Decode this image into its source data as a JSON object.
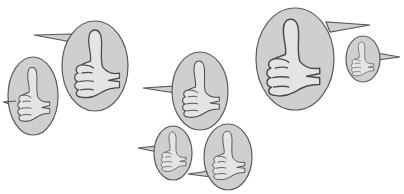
{
  "illustration": {
    "subject": "thumbs-up speech bubbles",
    "colors": {
      "background": "#ffffff",
      "bubble_fill": "#cfcfcf",
      "bubble_stroke": "#5a5a5a",
      "hand_fill": "#e4e4e4",
      "hand_stroke": "#4a4a4a"
    },
    "bubbles": [
      {
        "id": "a",
        "cx": 33,
        "cy": 96,
        "rx": 25,
        "ry": 39,
        "tail": "left",
        "tail_tip": [
          4,
          102
        ],
        "tail_base_y": [
          100,
          106
        ]
      },
      {
        "id": "b",
        "cx": 95,
        "cy": 66,
        "rx": 33,
        "ry": 45,
        "tail": "left",
        "tail_tip": [
          34,
          35
        ],
        "tail_base_y": [
          34,
          40
        ]
      },
      {
        "id": "c",
        "cx": 200,
        "cy": 91,
        "rx": 28,
        "ry": 39,
        "tail": "left",
        "tail_tip": [
          143,
          88
        ],
        "tail_base_y": [
          86,
          92
        ]
      },
      {
        "id": "d",
        "cx": 173,
        "cy": 153,
        "rx": 19,
        "ry": 27,
        "tail": "left",
        "tail_tip": [
          138,
          148
        ],
        "tail_base_y": [
          146,
          151
        ]
      },
      {
        "id": "e",
        "cx": 228,
        "cy": 157,
        "rx": 24,
        "ry": 33,
        "tail": "left",
        "tail_tip": [
          188,
          174
        ],
        "tail_base_y": [
          171,
          176
        ]
      },
      {
        "id": "f",
        "cx": 295,
        "cy": 59,
        "rx": 39,
        "ry": 51,
        "tail": "right",
        "tail_tip": [
          370,
          25
        ],
        "tail_base_y": [
          22,
          30
        ]
      },
      {
        "id": "g",
        "cx": 363,
        "cy": 59,
        "rx": 17,
        "ry": 23,
        "tail": "right",
        "tail_tip": [
          400,
          57
        ],
        "tail_base_y": [
          53,
          58
        ]
      }
    ]
  }
}
